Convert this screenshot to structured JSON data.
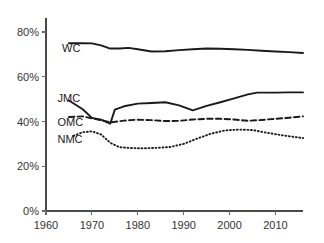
{
  "chart_data": {
    "type": "line",
    "title": "",
    "subtitle": "",
    "xlabel": "",
    "ylabel": "",
    "xlim": [
      1960,
      2016
    ],
    "ylim": [
      0,
      85
    ],
    "grid": false,
    "legend_position": "inline-left",
    "x_ticks": [
      1960,
      1970,
      1980,
      1990,
      2000,
      2010
    ],
    "x_tick_labels": [
      "1960",
      "1970",
      "1980",
      "1990",
      "2000",
      "2010"
    ],
    "y_ticks": [
      0,
      20,
      40,
      60,
      80
    ],
    "y_tick_labels": [
      "0%",
      "20%",
      "40%",
      "60%",
      "80%"
    ],
    "series": [
      {
        "name": "WC",
        "label": "WC",
        "style": "solid",
        "color": "#1a1a1a",
        "x": [
          1965,
          1968,
          1970,
          1972,
          1974,
          1976,
          1978,
          1980,
          1983,
          1986,
          1989,
          1992,
          1995,
          1998,
          2001,
          2004,
          2007,
          2010,
          2013,
          2016
        ],
        "values": [
          75.0,
          75.0,
          74.9,
          74.0,
          72.6,
          72.6,
          72.9,
          72.3,
          71.3,
          71.4,
          71.9,
          72.3,
          72.6,
          72.5,
          72.3,
          72.0,
          71.6,
          71.3,
          71.0,
          70.6
        ]
      },
      {
        "name": "JMC",
        "label": "JMC",
        "style": "solid",
        "color": "#1a1a1a",
        "x": [
          1965,
          1968,
          1970,
          1972,
          1974,
          1975,
          1977,
          1980,
          1983,
          1986,
          1989,
          1992,
          1995,
          1998,
          2001,
          2004,
          2006,
          2010,
          2013,
          2016
        ],
        "values": [
          49.4,
          45.5,
          41.6,
          40.8,
          39.0,
          45.3,
          46.8,
          48.0,
          48.3,
          48.6,
          47.2,
          45.0,
          47.0,
          48.6,
          50.3,
          52.1,
          52.9,
          52.9,
          53.0,
          53.0
        ]
      },
      {
        "name": "OMC",
        "label": "OMC",
        "style": "dashed",
        "color": "#1a1a1a",
        "x": [
          1965,
          1968,
          1970,
          1972,
          1974,
          1977,
          1980,
          1983,
          1986,
          1989,
          1992,
          1995,
          1998,
          2001,
          2004,
          2007,
          2010,
          2013,
          2016
        ],
        "values": [
          42.0,
          42.3,
          41.4,
          40.6,
          39.6,
          40.4,
          40.8,
          40.6,
          40.2,
          40.3,
          40.9,
          41.2,
          41.2,
          40.9,
          40.3,
          40.7,
          41.2,
          41.7,
          42.3
        ]
      },
      {
        "name": "NMC",
        "label": "NMC",
        "style": "dotted",
        "color": "#1a1a1a",
        "x": [
          1966,
          1968,
          1970,
          1972,
          1974,
          1976,
          1978,
          1981,
          1984,
          1987,
          1990,
          1993,
          1996,
          1999,
          2002,
          2005,
          2008,
          2011,
          2013,
          2016
        ],
        "values": [
          33.6,
          35.2,
          35.6,
          34.2,
          30.5,
          28.5,
          28.2,
          28.0,
          28.2,
          28.6,
          30.0,
          32.4,
          34.6,
          36.0,
          36.4,
          36.2,
          35.0,
          34.0,
          33.4,
          32.6
        ]
      }
    ],
    "series_label_positions": [
      {
        "name": "WC",
        "x": 1963.5,
        "y": 73.0
      },
      {
        "name": "JMC",
        "x": 1962.5,
        "y": 50.5
      },
      {
        "name": "OMC",
        "x": 1962.5,
        "y": 40.0
      },
      {
        "name": "NMC",
        "x": 1962.5,
        "y": 32.0
      }
    ],
    "colors": {
      "axis": "#4a4a4a",
      "tick_text": "#333333",
      "series_line": "#1a1a1a",
      "background": "#ffffff"
    }
  }
}
